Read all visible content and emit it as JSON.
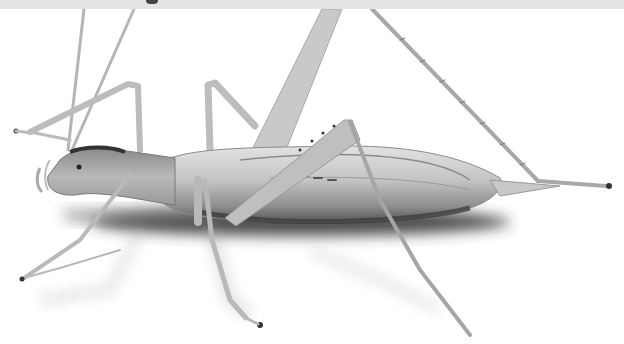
{
  "image": {
    "subject": "pale translucent katydid-like insect, side view, on white background",
    "background_color": "#ffffff",
    "top_band_color": "#e3e3e3",
    "insect_colors": {
      "body_light": "#d2d2d2",
      "body_mid": "#a8a8a8",
      "body_dark": "#555555",
      "leg": "#bdbdbd",
      "shadow": "#3a3a3a"
    }
  }
}
